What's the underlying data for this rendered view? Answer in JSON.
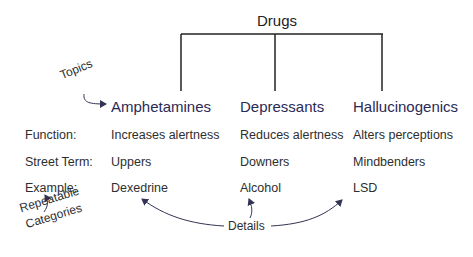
{
  "diagram": {
    "root": "Drugs",
    "topics": [
      "Amphetamines",
      "Depressants",
      "Hallucinogenics"
    ],
    "rows": [
      {
        "label": "Function:",
        "values": [
          "Increases alertness",
          "Reduces alertness",
          "Alters perceptions"
        ]
      },
      {
        "label": "Street Term:",
        "values": [
          "Uppers",
          "Downers",
          "Mindbenders"
        ]
      },
      {
        "label": "Example:",
        "values": [
          "Dexedrine",
          "Alcohol",
          "LSD"
        ]
      }
    ],
    "annotations": {
      "topics": "Topics",
      "categories_line1": "Repeatable",
      "categories_line2": "Categories",
      "details": "Details"
    },
    "colors": {
      "line": "#222222",
      "topic_text": "#2a2a55",
      "arrow": "#3a3a5a"
    }
  }
}
